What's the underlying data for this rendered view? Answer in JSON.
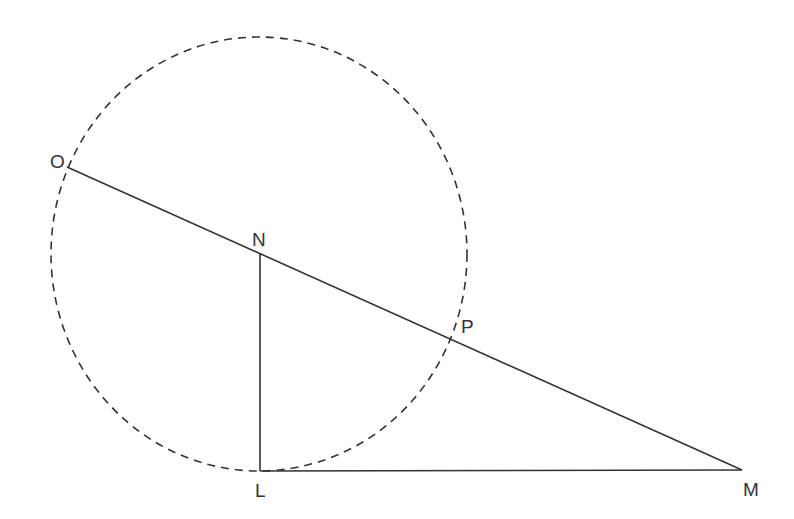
{
  "figure": {
    "type": "geometry-diagram",
    "stroke_color": "#333333",
    "circle": {
      "style": "dashed",
      "cx": 259,
      "cy": 254,
      "rx": 208,
      "ry": 217
    },
    "points": [
      {
        "name": "O",
        "x": 67,
        "y": 167,
        "label_x": 50,
        "label_y": 168
      },
      {
        "name": "N",
        "x": 260,
        "y": 254,
        "label_x": 252,
        "label_y": 246
      },
      {
        "name": "P",
        "x": 452,
        "y": 340,
        "label_x": 461,
        "label_y": 333
      },
      {
        "name": "L",
        "x": 260,
        "y": 471,
        "label_x": 255,
        "label_y": 497
      },
      {
        "name": "M",
        "x": 742,
        "y": 470,
        "label_x": 743,
        "label_y": 496
      }
    ],
    "segments": [
      {
        "from": "O",
        "to": "M",
        "style": "solid"
      },
      {
        "from": "N",
        "to": "L",
        "style": "solid"
      },
      {
        "from": "L",
        "to": "M",
        "style": "solid"
      }
    ]
  }
}
